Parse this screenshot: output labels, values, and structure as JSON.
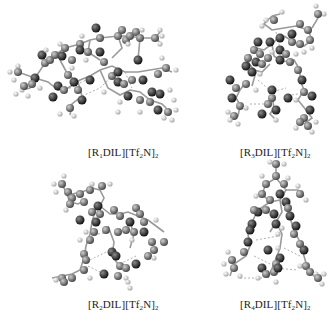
{
  "figure": {
    "panels": [
      {
        "id": "R1",
        "caption": {
          "prefix": "[R",
          "sub1": "1",
          "mid": "DIL][Tf",
          "sub2": "2",
          "mid2": "N]",
          "sub3": "2"
        },
        "caption_text": "[R1DIL][Tf2N]2",
        "position": "top-left"
      },
      {
        "id": "R3",
        "caption": {
          "prefix": "[R",
          "sub1": "3",
          "mid": "DIL][Tf",
          "sub2": "2",
          "mid2": "N]",
          "sub3": "2"
        },
        "caption_text": "[R3DIL][Tf2N]2",
        "position": "top-right"
      },
      {
        "id": "R2",
        "caption": {
          "prefix": "[R",
          "sub1": "2",
          "mid": "DIL][Tf",
          "sub2": "2",
          "mid2": "N]",
          "sub3": "2"
        },
        "caption_text": "[R2DIL][Tf2N]2",
        "position": "bottom-left"
      },
      {
        "id": "R4",
        "caption": {
          "prefix": "[R",
          "sub1": "4",
          "mid": "DIL][Tf",
          "sub2": "2",
          "mid2": "N]",
          "sub3": "2"
        },
        "caption_text": "[R4DIL][Tf2N]2",
        "position": "bottom-right"
      }
    ],
    "atom_colors": {
      "hydrogen": "#d8d8d8",
      "carbon": "#7a7a7a",
      "heteroatom": "#2e2e2e"
    },
    "bond_color": "#9a9a9a",
    "hbond_color": "#b0b0b0"
  }
}
